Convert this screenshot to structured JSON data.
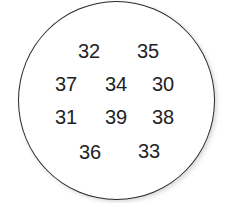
{
  "figure": {
    "shape": "circle",
    "border_color": "#2a2a2a",
    "fill_color": "#ffffff",
    "numbers": [
      {
        "value": "32",
        "x": 89,
        "y": 51
      },
      {
        "value": "35",
        "x": 148,
        "y": 51
      },
      {
        "value": "37",
        "x": 66,
        "y": 84
      },
      {
        "value": "34",
        "x": 116,
        "y": 84
      },
      {
        "value": "30",
        "x": 163,
        "y": 84
      },
      {
        "value": "31",
        "x": 66,
        "y": 117
      },
      {
        "value": "39",
        "x": 116,
        "y": 117
      },
      {
        "value": "38",
        "x": 163,
        "y": 117
      },
      {
        "value": "36",
        "x": 90,
        "y": 152
      },
      {
        "value": "33",
        "x": 149,
        "y": 151
      }
    ]
  }
}
